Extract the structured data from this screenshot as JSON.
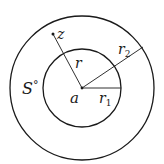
{
  "diagram": {
    "labels": {
      "z": "z",
      "r": "r",
      "r2": "r",
      "r2_sub": "2",
      "r1": "r",
      "r1_sub": "1",
      "a": "a",
      "S": "S",
      "S_sup": "°"
    },
    "colors": {
      "stroke": "#1a1a1a",
      "background": "#ffffff"
    }
  }
}
